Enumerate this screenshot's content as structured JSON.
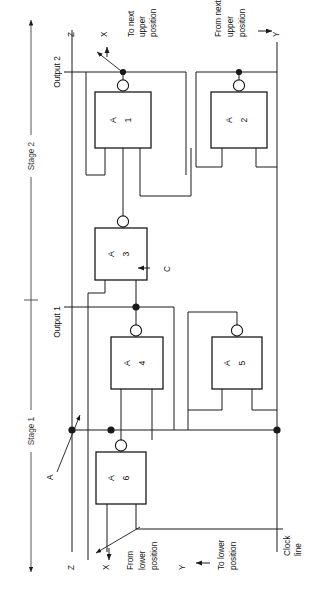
{
  "diagram": {
    "stages": [
      {
        "id": "stage-2",
        "label": "Stage 2"
      },
      {
        "id": "stage-1",
        "label": "Stage 1"
      }
    ],
    "gates": [
      {
        "id": "a1",
        "letter": "A",
        "number": "1"
      },
      {
        "id": "a2",
        "letter": "A",
        "number": "2"
      },
      {
        "id": "a3",
        "letter": "A",
        "number": "3"
      },
      {
        "id": "a4",
        "letter": "A",
        "number": "4"
      },
      {
        "id": "a5",
        "letter": "A",
        "number": "5"
      },
      {
        "id": "a6",
        "letter": "A",
        "number": "6"
      }
    ],
    "signals": {
      "output2": "Output 2",
      "output1": "Output 1",
      "z_top": "Z",
      "x_top": "X",
      "y_top": "Y",
      "z_bottom": "Z",
      "x_bottom": "X",
      "y_bottom": "Y",
      "c": "C",
      "a": "A"
    },
    "annotations": {
      "to_next_upper": "To next\nupper\nposition",
      "to_next_upper_l1": "To next",
      "to_next_upper_l2": "upper",
      "to_next_upper_l3": "position",
      "from_next_upper_l1": "From next",
      "from_next_upper_l2": "upper",
      "from_next_upper_l3": "position",
      "from_lower_l1": "From",
      "from_lower_l2": "lower",
      "from_lower_l3": "position",
      "to_lower_l1": "To lower",
      "to_lower_l2": "position",
      "clock_l1": "Clock",
      "clock_l2": "line"
    },
    "colors": {
      "line": "#1a1a1a",
      "text": "#111111",
      "stage_line": "#444444",
      "background": "#ffffff"
    }
  }
}
